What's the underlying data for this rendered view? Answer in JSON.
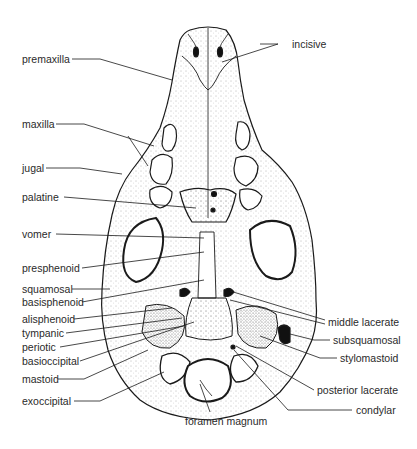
{
  "figure": {
    "line_color": "#1a1a1a",
    "stipple_color": "#555555",
    "background": "#ffffff"
  },
  "labels": {
    "left": [
      {
        "id": "premaxilla",
        "text": "premaxilla",
        "x": 22,
        "y": 53
      },
      {
        "id": "maxilla",
        "text": "maxilla",
        "x": 22,
        "y": 118
      },
      {
        "id": "jugal",
        "text": "jugal",
        "x": 22,
        "y": 162
      },
      {
        "id": "palatine",
        "text": "palatine",
        "x": 22,
        "y": 191
      },
      {
        "id": "vomer",
        "text": "vomer",
        "x": 22,
        "y": 228
      },
      {
        "id": "presphenoid",
        "text": "presphenoid",
        "x": 22,
        "y": 262
      },
      {
        "id": "squamosal",
        "text": "squamosal",
        "x": 22,
        "y": 283
      },
      {
        "id": "basisphenoid",
        "text": "basisphenoid",
        "x": 22,
        "y": 296
      },
      {
        "id": "alisphenoid",
        "text": "alisphenoid",
        "x": 22,
        "y": 313
      },
      {
        "id": "tympanic",
        "text": "tympanic",
        "x": 22,
        "y": 327
      },
      {
        "id": "periotic",
        "text": "periotic",
        "x": 22,
        "y": 341
      },
      {
        "id": "basioccipital",
        "text": "basioccipital",
        "x": 22,
        "y": 355
      },
      {
        "id": "mastoid",
        "text": "mastoid",
        "x": 22,
        "y": 373
      },
      {
        "id": "exoccipital",
        "text": "exoccipital",
        "x": 22,
        "y": 395
      }
    ],
    "right": [
      {
        "id": "incisive",
        "text": "incisive",
        "x": 292,
        "y": 38
      },
      {
        "id": "middle-lacerate",
        "text": "middle lacerate",
        "x": 328,
        "y": 316
      },
      {
        "id": "subsquamosal",
        "text": "subsquamosal",
        "x": 333,
        "y": 334
      },
      {
        "id": "stylomastoid",
        "text": "stylomastoid",
        "x": 340,
        "y": 352
      },
      {
        "id": "posterior-lacerate",
        "text": "posterior lacerate",
        "x": 317,
        "y": 384
      },
      {
        "id": "condylar",
        "text": "condylar",
        "x": 356,
        "y": 404
      }
    ],
    "bottom": [
      {
        "id": "foramen-magnum",
        "text": "foramen magnum",
        "x": 185,
        "y": 415
      }
    ]
  }
}
